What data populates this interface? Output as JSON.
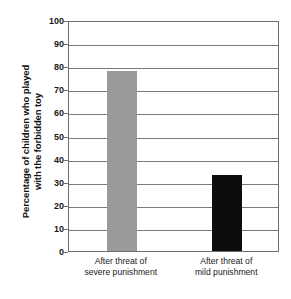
{
  "chart_data": {
    "type": "bar",
    "title": "",
    "xlabel": "",
    "ylabel": "Percentage of children who played\nwith the forbidden toy",
    "categories": [
      "After threat of\nsevere punishment",
      "After threat of\nmild punishment"
    ],
    "values": [
      78,
      33
    ],
    "bar_colors": [
      "#9a9a9a",
      "#0d0d0d"
    ],
    "ylim": [
      0,
      100
    ],
    "ytick_step": 10,
    "yticks": [
      100,
      90,
      80,
      70,
      60,
      50,
      40,
      30,
      20,
      10,
      0
    ],
    "ytick_labels": [
      "100",
      "90",
      "80",
      "70",
      "60",
      "50",
      "40",
      "30",
      "20",
      "10",
      "0"
    ],
    "grid": true,
    "grid_axis": "y",
    "legend": false,
    "legend_position": "none",
    "plot_border": true,
    "background_color": "#ffffff",
    "grid_color": "#7a7a7a",
    "axis_color": "#6e6e6e",
    "text_color": "#1a1a1a"
  }
}
